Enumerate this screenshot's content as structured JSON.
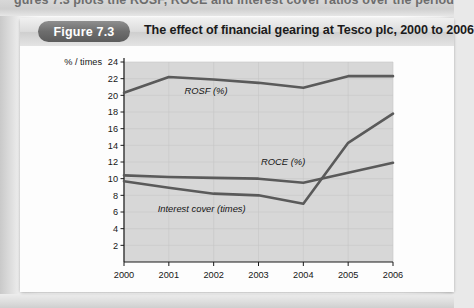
{
  "page": {
    "cut_off_line": "gures 7.3 plots the ROSF, ROCE and interest cover ratios over the period 2000 to 2",
    "figure_number": "Figure 7.3",
    "figure_title": "The effect of financial gearing at Tesco plc, 2000 to 2006"
  },
  "colors": {
    "line": "#5a5a5a",
    "plot_background": "#d7d7d7",
    "grid": "#c6c6c6",
    "axis": "#1a1a1a",
    "card": "#fdfdfd",
    "pill": "#6d6d6d"
  },
  "chart_data": {
    "type": "line",
    "title": "The effect of financial gearing at Tesco plc, 2000 to 2006",
    "xlabel": "",
    "ylabel": "% / times",
    "ylim": [
      0,
      24
    ],
    "ytick_step": 2,
    "yticks": [
      2,
      4,
      6,
      8,
      10,
      12,
      14,
      16,
      18,
      20,
      22,
      24
    ],
    "categories": [
      "2000",
      "2001",
      "2002",
      "2003",
      "2004",
      "2005",
      "2006"
    ],
    "x": [
      2000,
      2001,
      2002,
      2003,
      2004,
      2005,
      2006
    ],
    "grid": true,
    "legend": "inline-labels",
    "series": [
      {
        "name": "ROSF (%)",
        "label": "ROSF (%)",
        "values": [
          20.3,
          22.2,
          21.9,
          21.5,
          20.9,
          22.3,
          22.3
        ]
      },
      {
        "name": "ROCE (%)",
        "label": "ROCE (%)",
        "values": [
          10.4,
          10.2,
          10.1,
          10.0,
          9.5,
          10.7,
          11.9
        ]
      },
      {
        "name": "Interest cover (times)",
        "label": "Interest cover (times)",
        "values": [
          9.7,
          8.9,
          8.2,
          8.0,
          7.0,
          14.3,
          17.8
        ]
      }
    ]
  },
  "axis_labels": {
    "y_caption": "% / times",
    "y_ticks": [
      "24",
      "22",
      "20",
      "18",
      "16",
      "14",
      "12",
      "10",
      "8",
      "6",
      "4",
      "2"
    ],
    "x_ticks": [
      "2000",
      "2001",
      "2002",
      "2003",
      "2004",
      "2005",
      "2006"
    ]
  },
  "series_labels": {
    "rosf": "ROSF (%)",
    "roce": "ROCE (%)",
    "interest_cover": "Interest cover (times)"
  }
}
